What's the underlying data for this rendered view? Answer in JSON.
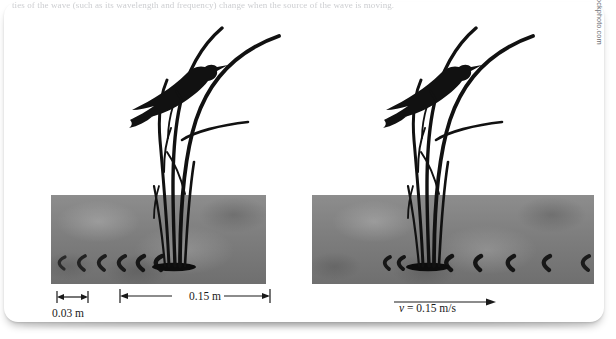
{
  "figure": {
    "clipped_caption": "ties of the wave (such as its wavelength and frequency) change when the source of the wave is moving.",
    "credit": "© Jean Labombarde/iStockphoto.com / © Tova Teitelbaum/iStockphoto.com"
  },
  "panels": [
    {
      "id": "stationary-source",
      "name": "left-panel",
      "labels": {
        "wavelength": "0.03 m",
        "span": "0.15 m"
      }
    },
    {
      "id": "moving-source",
      "name": "right-panel",
      "labels": {
        "velocity_symbol": "v",
        "velocity_equals": " = 0.15 m/s"
      }
    }
  ],
  "icons": {
    "bird": "bird-silhouette-icon",
    "reeds": "reed-stalks-icon",
    "ripple": "water-ripple-icon",
    "arrow": "velocity-arrow-icon"
  },
  "colors": {
    "card": "#ffffff",
    "water_light": "#8d8d8d",
    "water_dark": "#6f6f6f",
    "silhouette": "#111111",
    "label_text": "#1a1a1a",
    "credit_text": "#6e7177"
  }
}
